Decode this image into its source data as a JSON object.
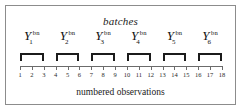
{
  "figure": {
    "title": "batches",
    "caption": "numbered observations",
    "border_color": "#8c8c8c",
    "background_color": "#ffffff",
    "ink_color": "#1b1b1b"
  },
  "batches": [
    {
      "base": "Y",
      "subscript": "1",
      "superscript": "bn",
      "observations": [
        1,
        2,
        3
      ]
    },
    {
      "base": "Y",
      "subscript": "2",
      "superscript": "bn",
      "observations": [
        4,
        5,
        6
      ]
    },
    {
      "base": "Y",
      "subscript": "3",
      "superscript": "bn",
      "observations": [
        7,
        8,
        9
      ]
    },
    {
      "base": "Y",
      "subscript": "4",
      "superscript": "bn",
      "observations": [
        10,
        11,
        12
      ]
    },
    {
      "base": "Y",
      "subscript": "5",
      "superscript": "bn",
      "observations": [
        13,
        14,
        15
      ]
    },
    {
      "base": "Y",
      "subscript": "6",
      "superscript": "bn",
      "observations": [
        16,
        17,
        18
      ]
    }
  ],
  "axis": {
    "label": "numbered observations",
    "ticks": [
      1,
      2,
      3,
      4,
      5,
      6,
      7,
      8,
      9,
      10,
      11,
      12,
      13,
      14,
      15,
      16,
      17,
      18
    ],
    "min": 1,
    "max": 18,
    "line_color": "#6b6b6b"
  },
  "chart_data": {
    "type": "diagram",
    "title": "batches",
    "xlabel": "numbered observations",
    "categories": [
      "Y_1^bn",
      "Y_2^bn",
      "Y_3^bn",
      "Y_4^bn",
      "Y_5^bn",
      "Y_6^bn"
    ],
    "groups": [
      {
        "name": "Y_1^bn",
        "members": [
          1,
          2,
          3
        ]
      },
      {
        "name": "Y_2^bn",
        "members": [
          4,
          5,
          6
        ]
      },
      {
        "name": "Y_3^bn",
        "members": [
          7,
          8,
          9
        ]
      },
      {
        "name": "Y_4^bn",
        "members": [
          10,
          11,
          12
        ]
      },
      {
        "name": "Y_5^bn",
        "members": [
          13,
          14,
          15
        ]
      },
      {
        "name": "Y_6^bn",
        "members": [
          16,
          17,
          18
        ]
      }
    ],
    "x": [
      1,
      2,
      3,
      4,
      5,
      6,
      7,
      8,
      9,
      10,
      11,
      12,
      13,
      14,
      15,
      16,
      17,
      18
    ],
    "xlim": [
      1,
      18
    ],
    "grid": false,
    "legend": "none"
  }
}
